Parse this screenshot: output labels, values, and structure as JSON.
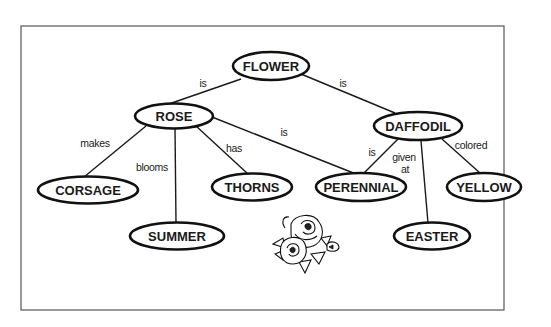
{
  "diagram": {
    "type": "semantic-network",
    "nodes": [
      {
        "id": "flower",
        "label": "FLOWER"
      },
      {
        "id": "rose",
        "label": "ROSE"
      },
      {
        "id": "daffodil",
        "label": "DAFFODIL"
      },
      {
        "id": "corsage",
        "label": "CORSAGE"
      },
      {
        "id": "summer",
        "label": "SUMMER"
      },
      {
        "id": "thorns",
        "label": "THORNS"
      },
      {
        "id": "perennial",
        "label": "PERENNIAL"
      },
      {
        "id": "easter",
        "label": "EASTER"
      },
      {
        "id": "yellow",
        "label": "YELLOW"
      }
    ],
    "edges": [
      {
        "from": "flower",
        "to": "rose",
        "label": "is"
      },
      {
        "from": "flower",
        "to": "daffodil",
        "label": "is"
      },
      {
        "from": "rose",
        "to": "corsage",
        "label": "makes"
      },
      {
        "from": "rose",
        "to": "summer",
        "label": "blooms"
      },
      {
        "from": "rose",
        "to": "thorns",
        "label": "has"
      },
      {
        "from": "rose",
        "to": "perennial",
        "label": "is"
      },
      {
        "from": "daffodil",
        "to": "perennial",
        "label": "is"
      },
      {
        "from": "daffodil",
        "to": "easter",
        "label_line1": "given",
        "label_line2": "at"
      },
      {
        "from": "daffodil",
        "to": "yellow",
        "label": "colored"
      }
    ],
    "illustration": "rose-bouquet"
  }
}
